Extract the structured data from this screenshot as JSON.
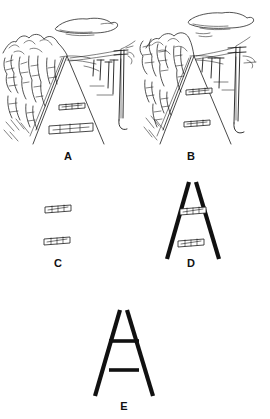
{
  "figure": {
    "background_color": "#ffffff",
    "ink_color": "#1a1a1a",
    "width": 270,
    "height": 419
  },
  "panels": [
    {
      "id": "A",
      "label": "A",
      "label_x": 68,
      "label_y": 160,
      "description": "Railway scene in perspective with hills at left, telegraph poles at right, cloud above, two sleeper bars on the track",
      "scene": "full-landscape",
      "has_converging_lines": true,
      "converging_style": "thin",
      "bars": [
        {
          "name": "upper-sleeper",
          "center_x": 72,
          "center_y": 106,
          "length": 26,
          "tilt": -3
        },
        {
          "name": "lower-sleeper",
          "center_x": 71,
          "center_y": 128,
          "length": 44,
          "tilt": -2
        }
      ],
      "elements": [
        "cloud",
        "hills",
        "trees",
        "telegraph-poles",
        "embankment",
        "track-lines"
      ]
    },
    {
      "id": "B",
      "label": "B",
      "label_x": 191,
      "label_y": 160,
      "description": "Same railway scene, sleeper bars placed higher and both short",
      "scene": "full-landscape",
      "has_converging_lines": true,
      "converging_style": "thin",
      "bars": [
        {
          "name": "upper-sleeper",
          "center_x": 199,
          "center_y": 91,
          "length": 26,
          "tilt": -3
        },
        {
          "name": "lower-sleeper",
          "center_x": 197,
          "center_y": 123,
          "length": 26,
          "tilt": -3
        }
      ],
      "elements": [
        "cloud",
        "hills",
        "trees",
        "telegraph-poles",
        "embankment",
        "track-lines"
      ]
    },
    {
      "id": "C",
      "label": "C",
      "label_x": 58,
      "label_y": 267,
      "description": "Two sleeper bars alone, no converging context lines",
      "scene": "bars-only",
      "has_converging_lines": false,
      "converging_style": "none",
      "bars": [
        {
          "name": "upper-sleeper",
          "center_x": 58,
          "center_y": 209,
          "length": 26,
          "tilt": -3
        },
        {
          "name": "lower-sleeper",
          "center_x": 57,
          "center_y": 241,
          "length": 26,
          "tilt": -3
        }
      ],
      "elements": []
    },
    {
      "id": "D",
      "label": "D",
      "label_x": 191,
      "label_y": 267,
      "description": "Two sleeper bars inside bold converging lines",
      "scene": "bars-with-lines",
      "has_converging_lines": true,
      "converging_style": "thick",
      "bars": [
        {
          "name": "upper-sleeper",
          "center_x": 193,
          "center_y": 211,
          "length": 26,
          "tilt": -3
        },
        {
          "name": "lower-sleeper",
          "center_x": 191,
          "center_y": 243,
          "length": 26,
          "tilt": -3
        }
      ],
      "elements": [
        "converging-lines"
      ]
    },
    {
      "id": "E",
      "label": "E",
      "label_x": 124,
      "label_y": 409,
      "description": "Abstract Ponzo figure: two plain bars between bold converging lines",
      "scene": "abstract",
      "has_converging_lines": true,
      "converging_style": "thick",
      "bars": [
        {
          "name": "upper-bar",
          "center_x": 124,
          "center_y": 342,
          "length": 30,
          "tilt": 0
        },
        {
          "name": "lower-bar",
          "center_x": 124,
          "center_y": 371,
          "length": 30,
          "tilt": 0
        }
      ],
      "elements": [
        "converging-lines"
      ]
    }
  ],
  "geometry": {
    "panel_a": {
      "vanishing_x": 67,
      "vanishing_y": 56,
      "left_foot_x": 33,
      "right_foot_x": 104,
      "foot_y": 144
    },
    "panel_b": {
      "vanishing_x": 194,
      "vanishing_y": 56,
      "left_foot_x": 160,
      "right_foot_x": 231,
      "foot_y": 144
    },
    "panel_d": {
      "apex_x": 192,
      "apex_y": 182,
      "left_foot_x": 167,
      "right_foot_x": 219,
      "foot_y": 259
    },
    "panel_e": {
      "apex_x": 123,
      "apex_y": 310,
      "left_foot_x": 95,
      "right_foot_x": 153,
      "foot_y": 396
    }
  }
}
